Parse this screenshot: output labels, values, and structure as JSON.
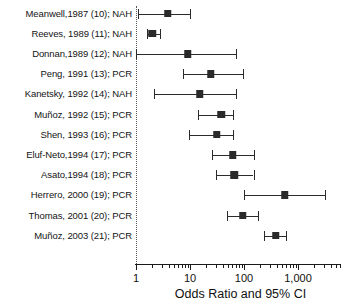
{
  "chart_data": {
    "type": "scatter",
    "subtype": "forest-plot",
    "title": "",
    "xlabel": "Odds Ratio and 95% CI",
    "ylabel": "",
    "xscale": "log",
    "xlim": [
      1,
      4000
    ],
    "grid": false,
    "legend": "none",
    "reference_line": 1,
    "tick_labels": [
      "1",
      "10",
      "100",
      "1,000"
    ],
    "tick_values": [
      1,
      10,
      100,
      1000
    ],
    "categories": [
      "Meanwell,1987 (10); NAH",
      "Reeves, 1989 (11); NAH",
      "Donnan,1989 (12); NAH",
      "Peng, 1991 (13); PCR",
      "Kanetsky, 1992 (14); NAH",
      "Muñoz, 1992 (15); PCR",
      "Shen, 1993 (16); PCR",
      "Eluf-Neto,1994 (17); PCR",
      "Asato,1994 (18); PCR",
      "Herrero, 2000 (19); PCR",
      "Thomas, 2001 (20); PCR",
      "Muñoz, 2003 (21); PCR"
    ],
    "rows": [
      {
        "label": "Meanwell,1987 (10); NAH",
        "or": 3.9,
        "lo": 1.1,
        "hi": 10.0
      },
      {
        "label": "Reeves, 1989 (11); NAH",
        "or": 2.0,
        "lo": 1.6,
        "hi": 2.8
      },
      {
        "label": "Donnan,1989 (12); NAH",
        "or": 9.0,
        "lo": 1.0,
        "hi": 70.0
      },
      {
        "label": "Peng, 1991 (13); PCR",
        "or": 24.0,
        "lo": 7.5,
        "hi": 95.0
      },
      {
        "label": "Kanetsky, 1992 (14); NAH",
        "or": 15.0,
        "lo": 2.2,
        "hi": 70.0
      },
      {
        "label": "Muñoz, 1992 (15); PCR",
        "or": 38.0,
        "lo": 14.0,
        "hi": 62.0
      },
      {
        "label": "Shen, 1993 (16); PCR",
        "or": 31.0,
        "lo": 9.5,
        "hi": 62.0
      },
      {
        "label": "Eluf-Neto,1994 (17); PCR",
        "or": 62.0,
        "lo": 26.0,
        "hi": 150.0
      },
      {
        "label": "Asato,1994 (18); PCR",
        "or": 66.0,
        "lo": 30.0,
        "hi": 150.0
      },
      {
        "label": "Herrero, 2000 (19); PCR",
        "or": 570.0,
        "lo": 100.0,
        "hi": 3100.0
      },
      {
        "label": "Thomas, 2001 (20); PCR",
        "or": 95.0,
        "lo": 48.0,
        "hi": 180.0
      },
      {
        "label": "Muñoz, 2003 (21); PCR",
        "or": 390.0,
        "lo": 230.0,
        "hi": 600.0
      }
    ]
  },
  "axis": {
    "title": "Odds Ratio and 95% CI",
    "labels": [
      {
        "text": "1",
        "value": 1
      },
      {
        "text": "10",
        "value": 10
      },
      {
        "text": "100",
        "value": 100
      },
      {
        "text": "1,000",
        "value": 1000
      }
    ]
  },
  "colors": {
    "marker": "#2a2a2a",
    "line": "#2b2b2b",
    "axis": "#1a1a1a",
    "reference": "#555555",
    "text": "#141414",
    "background": "#ffffff"
  }
}
